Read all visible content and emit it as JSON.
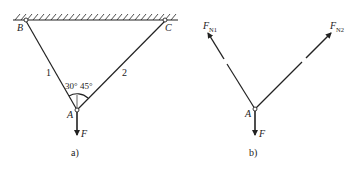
{
  "panel_a": {
    "caption": "a)",
    "labels": {
      "B": "B",
      "C": "C",
      "A": "A",
      "F": "F",
      "bar1": "1",
      "bar2": "2",
      "angle1": "30°",
      "angle2": "45°"
    }
  },
  "panel_b": {
    "caption": "b)",
    "labels": {
      "A": "A",
      "F": "F",
      "FN1_main": "F",
      "FN1_sub": "N1",
      "FN2_main": "F",
      "FN2_sub": "N2"
    }
  },
  "colors": {
    "line": "#222222",
    "background": "#ffffff"
  }
}
